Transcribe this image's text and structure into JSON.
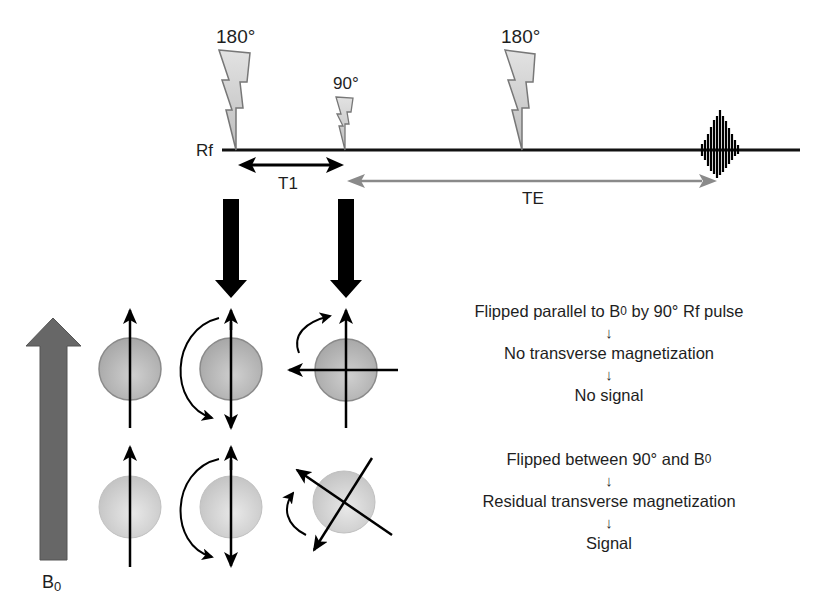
{
  "diagram": {
    "pulse_sequence": {
      "baseline_label": "Rf",
      "pulses": [
        {
          "label": "180°",
          "type": "inversion",
          "x": 236
        },
        {
          "label": "90°",
          "type": "excitation",
          "x": 345
        },
        {
          "label": "180°",
          "type": "refocusing",
          "x": 522
        }
      ],
      "echo": {
        "label": "signal echo",
        "x": 720
      },
      "intervals": [
        {
          "label": "T1",
          "from": "180° pulse",
          "to": "90° pulse",
          "color": "#000000"
        },
        {
          "label": "TE",
          "from": "90° pulse",
          "to": "echo",
          "color": "#808080"
        }
      ]
    },
    "field": {
      "label_main": "B",
      "label_sub": "0"
    },
    "rows": [
      {
        "id": "top",
        "sphere_color": "#b9b9b9",
        "description": {
          "line1_pre": "Flipped parallel to B",
          "line1_sub": "0",
          "line1_post": " by 90° Rf pulse",
          "arrow1": "↓",
          "line2": "No transverse magnetization",
          "arrow2": "↓",
          "line3": "No signal"
        }
      },
      {
        "id": "bottom",
        "sphere_color": "#d6d6d6",
        "description": {
          "line1_pre": "Flipped between 90° and B",
          "line1_sub": "0",
          "line1_post": "",
          "arrow1": "↓",
          "line2": "Residual transverse magnetization",
          "arrow2": "↓",
          "line3": "Signal"
        }
      }
    ],
    "colors": {
      "bolt_fill": "#d2d2d2",
      "bolt_stroke": "#7a7a7a",
      "b0_arrow": "#676767",
      "te_arrow": "#8a8a8a",
      "ink": "#000000"
    }
  }
}
